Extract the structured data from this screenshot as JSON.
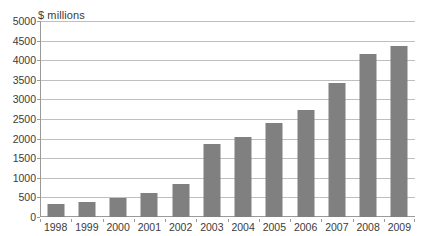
{
  "chart_data": {
    "type": "bar",
    "title": "",
    "subtitle": "",
    "xlabel": "",
    "ylabel": "$ millions",
    "ylim": [
      0,
      5000
    ],
    "ytick_step": 500,
    "yticks": [
      "5000",
      "4500",
      "4000",
      "3500",
      "3000",
      "2500",
      "2000",
      "1500",
      "1000",
      "500",
      "0"
    ],
    "grid": true,
    "legend": false,
    "legend_position": "none",
    "bar_color": "#808080",
    "gridline_color": "#bfbfbf",
    "axis_color": "#9a9a9a",
    "background_color": "#ffffff",
    "categories": [
      "1998",
      "1999",
      "2000",
      "2001",
      "2002",
      "2003",
      "2004",
      "2005",
      "2006",
      "2007",
      "2008",
      "2009"
    ],
    "values": [
      330,
      390,
      480,
      620,
      830,
      1850,
      2030,
      2400,
      2720,
      3430,
      4150,
      4350
    ],
    "series": [
      {
        "name": "",
        "values": [
          330,
          390,
          480,
          620,
          830,
          1850,
          2030,
          2400,
          2720,
          3430,
          4150,
          4350
        ]
      }
    ]
  }
}
